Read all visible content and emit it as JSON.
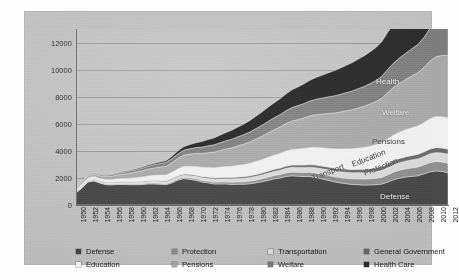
{
  "chart_data": {
    "type": "area",
    "title": "",
    "subtitle": "",
    "xlabel": "",
    "ylabel": "",
    "stacked": true,
    "grid": true,
    "legend_position": "bottom",
    "ylim": [
      0,
      13000
    ],
    "yticks": [
      0,
      2000,
      4000,
      6000,
      8000,
      10000,
      12000
    ],
    "ytick_labels": [
      "0",
      "2000",
      "4000",
      "6000",
      "8000",
      "10000",
      "12000"
    ],
    "xlim": [
      1950,
      2012
    ],
    "x": [
      1950,
      1951,
      1952,
      1953,
      1954,
      1955,
      1956,
      1957,
      1958,
      1959,
      1960,
      1961,
      1962,
      1963,
      1964,
      1965,
      1966,
      1967,
      1968,
      1969,
      1970,
      1971,
      1972,
      1973,
      1974,
      1975,
      1976,
      1977,
      1978,
      1979,
      1980,
      1981,
      1982,
      1983,
      1984,
      1985,
      1986,
      1987,
      1988,
      1989,
      1990,
      1991,
      1992,
      1993,
      1994,
      1995,
      1996,
      1997,
      1998,
      1999,
      2000,
      2001,
      2002,
      2003,
      2004,
      2005,
      2006,
      2007,
      2008,
      2009,
      2010,
      2011,
      2012
    ],
    "xtick_labels": [
      "1950",
      "1952",
      "1954",
      "1956",
      "1958",
      "1960",
      "1962",
      "1964",
      "1966",
      "1968",
      "1970",
      "1972",
      "1974",
      "1976",
      "1978",
      "1980",
      "1982",
      "1984",
      "1986",
      "1988",
      "1990",
      "1992",
      "1994",
      "1996",
      "1998",
      "2000",
      "2002",
      "2004",
      "2006",
      "2008",
      "2010",
      "2012"
    ],
    "series": [
      {
        "name": "Defense",
        "color": "#4a4a4a",
        "values": [
          900,
          1250,
          1700,
          1780,
          1620,
          1500,
          1490,
          1520,
          1510,
          1500,
          1500,
          1510,
          1560,
          1560,
          1540,
          1500,
          1640,
          1840,
          1950,
          1900,
          1820,
          1700,
          1640,
          1560,
          1560,
          1560,
          1520,
          1540,
          1540,
          1570,
          1640,
          1720,
          1830,
          1930,
          2000,
          2110,
          2160,
          2130,
          2100,
          2100,
          2030,
          1930,
          1830,
          1720,
          1640,
          1580,
          1520,
          1500,
          1470,
          1480,
          1500,
          1550,
          1700,
          1880,
          1990,
          2070,
          2120,
          2160,
          2300,
          2450,
          2520,
          2480,
          2380
        ]
      },
      {
        "name": "Protection",
        "color": "#8f8f8f",
        "values": [
          40,
          42,
          45,
          46,
          48,
          50,
          52,
          54,
          56,
          58,
          60,
          63,
          66,
          70,
          74,
          78,
          84,
          90,
          96,
          104,
          112,
          120,
          128,
          136,
          144,
          152,
          162,
          172,
          182,
          194,
          206,
          218,
          230,
          242,
          254,
          268,
          280,
          292,
          306,
          320,
          334,
          348,
          362,
          376,
          390,
          404,
          418,
          432,
          446,
          460,
          476,
          500,
          540,
          570,
          590,
          610,
          630,
          650,
          670,
          690,
          700,
          705,
          710
        ]
      },
      {
        "name": "Transportation",
        "color": "#d8d8d8",
        "values": [
          60,
          64,
          68,
          72,
          76,
          82,
          88,
          94,
          100,
          108,
          116,
          122,
          128,
          134,
          140,
          148,
          156,
          164,
          172,
          180,
          188,
          196,
          204,
          212,
          220,
          228,
          238,
          248,
          258,
          268,
          280,
          290,
          300,
          310,
          320,
          332,
          344,
          354,
          364,
          376,
          388,
          398,
          408,
          418,
          428,
          438,
          448,
          458,
          470,
          482,
          494,
          510,
          528,
          544,
          558,
          572,
          586,
          600,
          614,
          640,
          660,
          665,
          668
        ]
      },
      {
        "name": "General Government",
        "color": "#6b6b6b",
        "values": [
          30,
          32,
          34,
          36,
          38,
          40,
          42,
          44,
          46,
          48,
          50,
          53,
          56,
          59,
          62,
          66,
          70,
          74,
          78,
          82,
          86,
          90,
          94,
          98,
          102,
          106,
          111,
          116,
          121,
          127,
          133,
          139,
          145,
          151,
          157,
          164,
          171,
          178,
          185,
          192,
          199,
          206,
          213,
          220,
          227,
          234,
          241,
          248,
          256,
          264,
          272,
          282,
          294,
          304,
          312,
          320,
          328,
          336,
          344,
          354,
          362,
          366,
          370
        ]
      },
      {
        "name": "Education",
        "color": "#efefef",
        "values": [
          130,
          140,
          150,
          162,
          176,
          192,
          208,
          226,
          246,
          268,
          292,
          316,
          340,
          366,
          394,
          428,
          470,
          516,
          560,
          600,
          640,
          676,
          710,
          742,
          772,
          800,
          830,
          860,
          890,
          922,
          956,
          986,
          1014,
          1044,
          1076,
          1112,
          1148,
          1184,
          1222,
          1262,
          1302,
          1340,
          1378,
          1416,
          1454,
          1492,
          1530,
          1568,
          1610,
          1654,
          1700,
          1760,
          1840,
          1900,
          1950,
          2000,
          2050,
          2100,
          2160,
          2240,
          2300,
          2310,
          2320
        ]
      },
      {
        "name": "Pensions",
        "color": "#a8a8a8",
        "values": [
          110,
          130,
          152,
          176,
          202,
          230,
          262,
          296,
          334,
          374,
          416,
          460,
          504,
          550,
          598,
          650,
          706,
          766,
          828,
          892,
          958,
          1024,
          1090,
          1158,
          1226,
          1294,
          1364,
          1434,
          1506,
          1580,
          1656,
          1730,
          1804,
          1878,
          1952,
          2028,
          2104,
          2180,
          2258,
          2336,
          2416,
          2494,
          2572,
          2650,
          2728,
          2806,
          2884,
          2962,
          3042,
          3122,
          3204,
          3300,
          3420,
          3520,
          3620,
          3720,
          3830,
          3940,
          4080,
          4260,
          4420,
          4520,
          4620
        ]
      },
      {
        "name": "Welfare",
        "color": "#7d7d7d",
        "values": [
          60,
          66,
          74,
          82,
          92,
          102,
          114,
          128,
          142,
          158,
          176,
          194,
          214,
          234,
          256,
          280,
          308,
          338,
          370,
          402,
          436,
          470,
          504,
          538,
          572,
          606,
          640,
          674,
          708,
          744,
          780,
          814,
          848,
          882,
          916,
          952,
          988,
          1024,
          1062,
          1100,
          1140,
          1180,
          1220,
          1260,
          1300,
          1340,
          1380,
          1420,
          1462,
          1506,
          1550,
          1620,
          1720,
          1800,
          1870,
          1940,
          2010,
          2080,
          2220,
          2420,
          2560,
          2600,
          2640
        ]
      },
      {
        "name": "Health Care",
        "color": "#2d2d2d",
        "values": [
          20,
          22,
          25,
          28,
          32,
          36,
          40,
          46,
          52,
          60,
          68,
          78,
          88,
          100,
          112,
          126,
          160,
          210,
          260,
          310,
          360,
          410,
          460,
          510,
          560,
          610,
          665,
          720,
          780,
          845,
          910,
          975,
          1040,
          1105,
          1170,
          1240,
          1310,
          1380,
          1455,
          1530,
          1610,
          1690,
          1770,
          1850,
          1930,
          2010,
          2090,
          2170,
          2255,
          2340,
          2430,
          2560,
          2740,
          2880,
          3000,
          3120,
          3240,
          3360,
          3560,
          3860,
          4080,
          4160,
          4240
        ]
      }
    ],
    "series_annotations": [
      {
        "label": "Health",
        "color_class": "light"
      },
      {
        "label": "Welfare",
        "color_class": "light"
      },
      {
        "label": "Pensions",
        "color_class": "dark"
      },
      {
        "label": "Education",
        "color_class": "dark"
      },
      {
        "label": "Protection",
        "color_class": "dark"
      },
      {
        "label": "Transport",
        "color_class": "dark"
      },
      {
        "label": "Defense",
        "color_class": "light"
      }
    ],
    "legend": [
      {
        "label": "Defense",
        "color": "#4a4a4a"
      },
      {
        "label": "Protection",
        "color": "#8f8f8f"
      },
      {
        "label": "Transportation",
        "color": "#d8d8d8"
      },
      {
        "label": "General Government",
        "color": "#6b6b6b"
      },
      {
        "label": "Education",
        "color": "#efefef"
      },
      {
        "label": "Pensions",
        "color": "#a8a8a8"
      },
      {
        "label": "Welfare",
        "color": "#7d7d7d"
      },
      {
        "label": "Health Care",
        "color": "#2d2d2d"
      }
    ],
    "colors": {
      "panel_background": "#bfbfbf",
      "plot_background": "#c2c2c2",
      "gridline": "#9a9a9a",
      "axis": "#6e6e6e",
      "tick_text": "#262626"
    }
  }
}
